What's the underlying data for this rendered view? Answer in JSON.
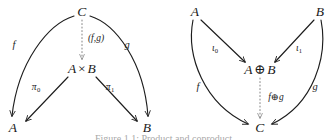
{
  "figure": {
    "kind": "category-theory-commutative-diagrams",
    "caption_fragment": "Figure 1.1: Product and coproduct",
    "ink_color": "#1d1d1d",
    "background_color": "#ffffff",
    "dotted_edge_color": "#8a8a8a"
  },
  "diagrams": [
    {
      "id": "product",
      "name": "binary-product-diagram",
      "nodes": [
        {
          "id": "C",
          "label_parts": {
            "text": "C"
          },
          "x": 82,
          "y": 12
        },
        {
          "id": "AxB",
          "label_parts": {
            "left": "A",
            "op": "×",
            "right": "B"
          },
          "x": 82,
          "y": 69
        },
        {
          "id": "A",
          "label_parts": {
            "text": "A"
          },
          "x": 13,
          "y": 128
        },
        {
          "id": "B",
          "label_parts": {
            "text": "B"
          },
          "x": 147,
          "y": 128
        }
      ],
      "edges": [
        {
          "id": "f",
          "from": "C",
          "to": "A",
          "label": "f",
          "style": "solid",
          "label_x": 14,
          "label_y": 45
        },
        {
          "id": "fg",
          "from": "C",
          "to": "AxB",
          "label": "(f,g)",
          "style": "dotted",
          "label_x": 96,
          "label_y": 39
        },
        {
          "id": "g",
          "from": "C",
          "to": "B",
          "label": "g",
          "style": "solid",
          "label_x": 127,
          "label_y": 45
        },
        {
          "id": "pi0",
          "from": "AxB",
          "to": "A",
          "label": "π",
          "sub": "0",
          "style": "solid",
          "label_x": 36,
          "label_y": 88
        },
        {
          "id": "pi1",
          "from": "AxB",
          "to": "B",
          "label": "π",
          "sub": "1",
          "style": "solid",
          "label_x": 110,
          "label_y": 88
        }
      ]
    },
    {
      "id": "coproduct",
      "name": "binary-coproduct-diagram",
      "nodes": [
        {
          "id": "A",
          "label_parts": {
            "text": "A"
          },
          "x": 195,
          "y": 12
        },
        {
          "id": "B",
          "label_parts": {
            "text": "B"
          },
          "x": 320,
          "y": 12
        },
        {
          "id": "AoB",
          "label_parts": {
            "left": "A",
            "op": "⊕",
            "right": "B"
          },
          "x": 260,
          "y": 70
        },
        {
          "id": "C",
          "label_parts": {
            "text": "C"
          },
          "x": 260,
          "y": 128
        }
      ],
      "edges": [
        {
          "id": "i0",
          "from": "A",
          "to": "AoB",
          "label": "ι",
          "sub": "0",
          "style": "solid",
          "label_x": 215,
          "label_y": 49
        },
        {
          "id": "i1",
          "from": "B",
          "to": "AoB",
          "label": "ι",
          "sub": "1",
          "style": "solid",
          "label_x": 299,
          "label_y": 49
        },
        {
          "id": "f",
          "from": "A",
          "to": "C",
          "label": "f",
          "style": "solid",
          "label_x": 198,
          "label_y": 87
        },
        {
          "id": "fog",
          "from": "AoB",
          "to": "C",
          "label": "f⊕g",
          "style": "dotted",
          "label_x": 276,
          "label_y": 98
        },
        {
          "id": "g",
          "from": "B",
          "to": "C",
          "label": "g",
          "style": "solid",
          "label_x": 315,
          "label_y": 87
        }
      ]
    }
  ]
}
